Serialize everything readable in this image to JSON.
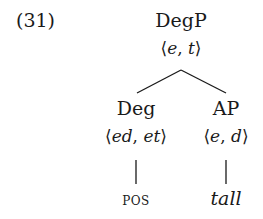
{
  "example": {
    "number": "(31)"
  },
  "tree": {
    "root": {
      "label": "DegP",
      "type_open": "⟨",
      "type_a": "e",
      "type_sep": ", ",
      "type_b": "t",
      "type_close": "⟩"
    },
    "left": {
      "label": "Deg",
      "type_open": "⟨",
      "type_a": "ed",
      "type_sep": ", ",
      "type_b": "et",
      "type_close": "⟩",
      "leaf": "pos"
    },
    "right": {
      "label": "AP",
      "type_open": "⟨",
      "type_a": "e",
      "type_sep": ", ",
      "type_b": "d",
      "type_close": "⟩",
      "leaf": "tall"
    }
  }
}
